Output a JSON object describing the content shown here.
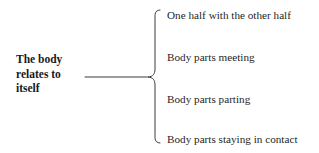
{
  "diagram": {
    "type": "brace-diagram",
    "background_color": "#ffffff",
    "stroke_color": "#3a3a3a",
    "text_color": "#1a1a1a",
    "root": {
      "text": "The body relates to itself",
      "lines": [
        "The body",
        "relates to",
        "itself"
      ]
    },
    "connector": {
      "name": "horizontal-connector-line",
      "x_start": 85,
      "x_end": 148,
      "y": 77
    },
    "brace": {
      "name": "curly-brace",
      "orientation": "left-pointing",
      "top": 10,
      "bottom": 143,
      "cusp_y": 77,
      "x_spine": 155
    },
    "branches": [
      {
        "label": "One half with the other half"
      },
      {
        "label": "Body parts meeting"
      },
      {
        "label": "Body parts parting"
      },
      {
        "label": "Body parts staying in contact"
      }
    ]
  }
}
